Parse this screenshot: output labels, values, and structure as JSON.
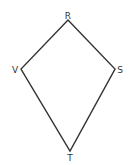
{
  "diagram": {
    "type": "kite",
    "stroke_color": "#333333",
    "vertices": [
      {
        "name": "R",
        "x": 68,
        "y": 20,
        "label_x": 68,
        "label_y": 19
      },
      {
        "name": "S",
        "x": 115,
        "y": 69,
        "label_x": 120,
        "label_y": 73
      },
      {
        "name": "T",
        "x": 70,
        "y": 151,
        "label_x": 70,
        "label_y": 161
      },
      {
        "name": "V",
        "x": 21,
        "y": 69,
        "label_x": 15,
        "label_y": 73
      }
    ],
    "labels": {
      "r": "R",
      "s": "S",
      "t": "T",
      "v": "V"
    }
  }
}
